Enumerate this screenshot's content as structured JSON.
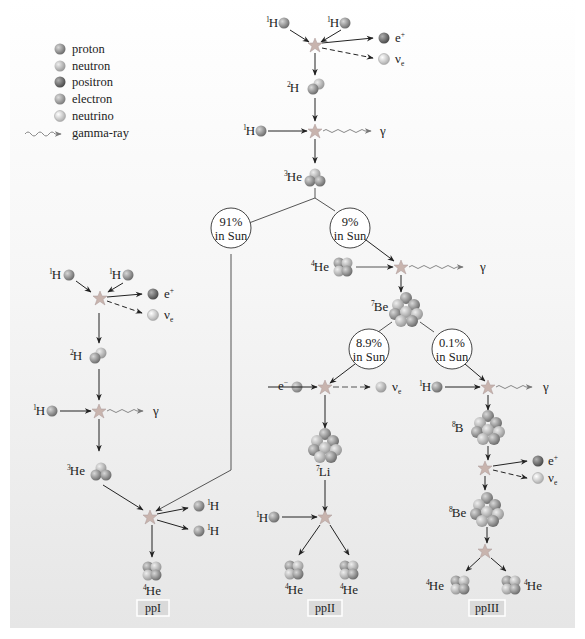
{
  "legend": {
    "items": [
      {
        "name": "proton",
        "color": "#8a8a8a"
      },
      {
        "name": "neutron",
        "color": "#b5b5b5"
      },
      {
        "name": "positron",
        "color": "#6e6e6e"
      },
      {
        "name": "electron",
        "color": "#9e9e9e"
      },
      {
        "name": "neutrino",
        "color": "#d2d2d2"
      },
      {
        "name": "gamma-ray",
        "color": "#888888"
      }
    ]
  },
  "labels": {
    "H": "H",
    "He": "He",
    "Be": "Be",
    "Li": "Li",
    "B": "B",
    "e_plus": "e",
    "plus": "+",
    "e_minus": "e",
    "minus": "−",
    "nu": "ν",
    "nu_sub": "e",
    "gamma": "γ"
  },
  "nuclide_numbers": {
    "H1": {
      "A": "1",
      "Z": "1"
    },
    "H2": {
      "A": "2",
      "Z": "1"
    },
    "He3": {
      "A": "3",
      "Z": "2"
    },
    "He4": {
      "A": "4",
      "Z": "2"
    },
    "Be7": {
      "A": "7",
      "Z": "4"
    },
    "Li7": {
      "A": "7",
      "Z": "3"
    },
    "B8": {
      "A": "8",
      "Z": "5"
    },
    "Be8": {
      "A": "8",
      "Z": "4"
    }
  },
  "branches": {
    "b91": {
      "pct": "91%",
      "sub": "in Sun"
    },
    "b9": {
      "pct": "9%",
      "sub": "in Sun"
    },
    "b89": {
      "pct": "8.9%",
      "sub": "in Sun"
    },
    "b01": {
      "pct": "0.1%",
      "sub": "in Sun"
    }
  },
  "chains": {
    "ppI": "ppI",
    "ppII": "ppII",
    "ppIII": "ppIII"
  },
  "colors": {
    "proton": "#8a8a8a",
    "neutron": "#b8b8b8",
    "positron": "#6a6a6a",
    "neutrino": "#d4d4d4",
    "star": "#c9b5b0",
    "arrow": "#222222",
    "line": "#555555"
  }
}
